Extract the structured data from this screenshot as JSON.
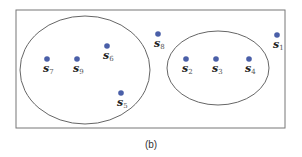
{
  "caption": "(b)",
  "colors": {
    "dot": "#4a5fa8",
    "stroke": "#666666"
  },
  "frame": {
    "x": 16,
    "y": 10,
    "width": 269,
    "height": 118
  },
  "clusters": [
    {
      "name": "left-cluster",
      "cx": 85,
      "cy": 70,
      "rx": 65,
      "ry": 54,
      "members": [
        "s7",
        "s9",
        "s6",
        "s5"
      ]
    },
    {
      "name": "right-cluster",
      "cx": 218,
      "cy": 68,
      "rx": 51,
      "ry": 37,
      "members": [
        "s2",
        "s3",
        "s4"
      ]
    }
  ],
  "points": [
    {
      "id": "s1",
      "base": "s",
      "sub": "1",
      "x": 277,
      "y": 35
    },
    {
      "id": "s2",
      "base": "s",
      "sub": "2",
      "x": 186,
      "y": 59
    },
    {
      "id": "s3",
      "base": "s",
      "sub": "3",
      "x": 216,
      "y": 59
    },
    {
      "id": "s4",
      "base": "s",
      "sub": "4",
      "x": 249,
      "y": 59
    },
    {
      "id": "s5",
      "base": "s",
      "sub": "5",
      "x": 121,
      "y": 93
    },
    {
      "id": "s6",
      "base": "s",
      "sub": "6",
      "x": 107,
      "y": 46
    },
    {
      "id": "s7",
      "base": "s",
      "sub": "7",
      "x": 47,
      "y": 59
    },
    {
      "id": "s8",
      "base": "s",
      "sub": "8",
      "x": 158,
      "y": 34
    },
    {
      "id": "s9",
      "base": "s",
      "sub": "9",
      "x": 77,
      "y": 59
    }
  ]
}
